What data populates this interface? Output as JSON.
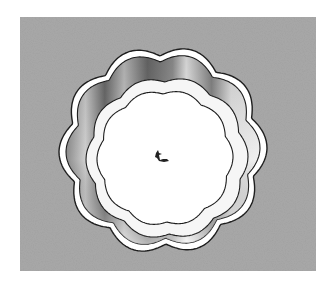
{
  "image": {
    "subject": "scalloped fluted tart pan, top-down view",
    "background_color": "#a9a9a9",
    "page_color": "#ffffff",
    "shape": {
      "center": [
        143,
        133
      ],
      "outer_radius": 102,
      "scallops": 10,
      "rim_color": "#ffffff",
      "outline_color": "#1e1e1e",
      "wall_shadow_color": "#6e6e6e",
      "base_color": "#ffffff"
    },
    "center_mark": "small dark speck"
  }
}
